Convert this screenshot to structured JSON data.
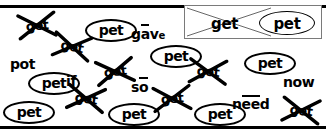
{
  "worksheet": {
    "rules": {
      "top_label": "top-divider-rule",
      "bottom_label": "bottom-divider-rule"
    },
    "example_box": {
      "crossed_word": "get",
      "circled_word": "pet"
    },
    "target_word": "pet",
    "distractor_word": "get",
    "circled_words": [
      {
        "text": "pet",
        "x": 85,
        "y": 19
      },
      {
        "text": "pet",
        "x": 150,
        "y": 45
      },
      {
        "text": "pet",
        "x": 244,
        "y": 52
      },
      {
        "text": "pet",
        "x": 28,
        "y": 72
      },
      {
        "text": "pet",
        "x": 3,
        "y": 101
      },
      {
        "text": "pet",
        "x": 108,
        "y": 103
      },
      {
        "text": "pet",
        "x": 194,
        "y": 103
      }
    ],
    "crossed_words": [
      {
        "text": "get",
        "x": 17,
        "y": 12,
        "rot": -6
      },
      {
        "text": "get",
        "x": 52,
        "y": 33,
        "rot": 10
      },
      {
        "text": "get",
        "x": 95,
        "y": 58,
        "rot": -8
      },
      {
        "text": "get",
        "x": 188,
        "y": 58,
        "rot": 4
      },
      {
        "text": "get",
        "x": 66,
        "y": 85,
        "rot": 8
      },
      {
        "text": "get",
        "x": 152,
        "y": 85,
        "rot": -5
      },
      {
        "text": "get",
        "x": 281,
        "y": 97,
        "rot": 6
      }
    ],
    "plain_words": [
      {
        "id": "gave",
        "pre": "g",
        "macron": "ā",
        "post": "v",
        "small": "e",
        "x": 131,
        "y": 27,
        "type": "macron-single"
      },
      {
        "id": "pot",
        "text": "pot",
        "x": 10,
        "y": 57,
        "type": "simple"
      },
      {
        "id": "if",
        "text": "if",
        "x": 66,
        "y": 74,
        "type": "simple"
      },
      {
        "id": "so",
        "pre": "s",
        "macron": "ō",
        "post": "",
        "x": 131,
        "y": 80,
        "type": "macron-single"
      },
      {
        "id": "now",
        "text": "now",
        "x": 283,
        "y": 75,
        "type": "simple"
      },
      {
        "id": "need",
        "pre": "n",
        "macron": "ee",
        "post": "d",
        "x": 232,
        "y": 97,
        "type": "macron-double"
      }
    ],
    "colors": {
      "ink": "#000000",
      "paper": "#ffffff",
      "box_border": "#7a7a7a"
    }
  }
}
